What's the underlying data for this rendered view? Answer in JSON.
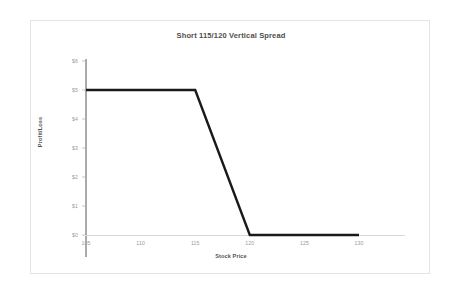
{
  "chart_data": {
    "type": "line",
    "title": "Short 115/120 Vertical Spread",
    "xlabel": "Stock Price",
    "ylabel": "Profit/Loss",
    "xlim": [
      105,
      130
    ],
    "ylim": [
      0,
      6
    ],
    "grid": false,
    "legend": false,
    "x_ticks": [
      "105",
      "110",
      "115",
      "120",
      "125",
      "130"
    ],
    "x_tick_values": [
      105,
      110,
      115,
      120,
      125,
      130
    ],
    "y_ticks": [
      "$0",
      "$1",
      "$2",
      "$3",
      "$4",
      "$5",
      "$6"
    ],
    "y_tick_values": [
      0,
      1,
      2,
      3,
      4,
      5,
      6
    ],
    "series": [
      {
        "name": "Profit/Loss at expiration",
        "color": "#1a1a1a",
        "x": [
          105,
          115,
          120,
          130
        ],
        "values": [
          5,
          5,
          0,
          0
        ]
      }
    ]
  }
}
